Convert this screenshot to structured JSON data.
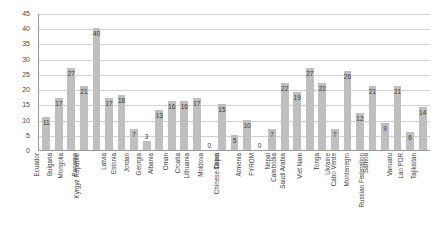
{
  "chart_data": {
    "type": "bar",
    "title": "",
    "subtitle": "",
    "xlabel": "",
    "ylabel": "",
    "ylim": [
      0,
      45
    ],
    "yticks": [
      0,
      5,
      10,
      15,
      20,
      25,
      30,
      35,
      40,
      45
    ],
    "grid": true,
    "legend": null,
    "legend_position": "none",
    "bar_color": "#bfbfbf",
    "grid_color": "#d2d2d2",
    "axis_color": "#9a9a9a",
    "label_color": "#3b3b3b",
    "show_value_labels": true,
    "xtick_rotation": -90,
    "categories": [
      "Ecuador",
      "Bulgaria",
      "Mongolia",
      "Panama",
      "Kyrgyz Republic",
      "Latvia",
      "Estonia",
      "Jordan",
      "Georgia",
      "Albania",
      "Oman",
      "Croatia",
      "Lithuania",
      "Moldova",
      "China",
      "Chinese Taipei",
      "Armenia",
      "FYROM",
      "Nepal",
      "Cambodia",
      "Saudi Arabia",
      "Viet Nam",
      "Tonga",
      "Ukraine",
      "Cabo Verde",
      "Montenegro",
      "Samoa",
      "Russian Federation",
      "Vanuatu",
      "Lao PDR",
      "Tajikistan"
    ],
    "values": [
      11,
      17,
      27,
      21,
      40,
      17,
      18,
      7,
      3,
      13,
      16,
      16,
      17,
      0,
      15,
      5,
      10,
      0,
      7,
      22,
      19,
      27,
      22,
      7,
      26,
      12,
      21,
      9,
      21,
      6,
      14
    ]
  }
}
